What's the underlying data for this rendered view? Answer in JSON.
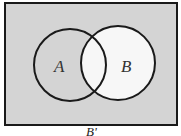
{
  "diagram": {
    "type": "venn",
    "sets": [
      {
        "label": "A",
        "shaded": true
      },
      {
        "label": "B",
        "shaded": false
      }
    ],
    "universe_shaded": true,
    "caption": "B'",
    "colors": {
      "shade": "#d4d4d4",
      "unshaded": "#f7f7f7",
      "stroke": "#1a1a1a"
    }
  }
}
